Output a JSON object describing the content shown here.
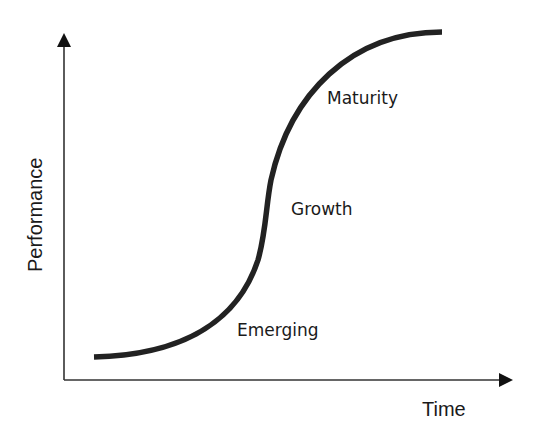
{
  "diagram": {
    "title": "",
    "type": "s-curve",
    "x_axis": {
      "label": "Time"
    },
    "y_axis": {
      "label": "Performance"
    },
    "phases": [
      {
        "name": "Emerging"
      },
      {
        "name": "Growth"
      },
      {
        "name": "Maturity"
      }
    ],
    "colors": {
      "curve": "#222222",
      "axis": "#333333",
      "text": "#1a1a1a",
      "background": "#ffffff"
    }
  }
}
